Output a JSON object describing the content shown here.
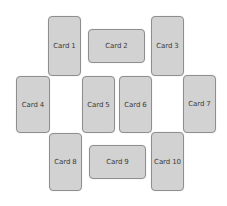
{
  "layout": {
    "background": "#ffffff",
    "card_fill": "#d2d2d2",
    "card_border": "#8e8e8e",
    "text_color": "#3b3b3b"
  },
  "cards": [
    {
      "label": "Card 1",
      "orientation": "portrait",
      "x": 48,
      "y": 16,
      "w": 33,
      "h": 60
    },
    {
      "label": "Card 2",
      "orientation": "landscape",
      "x": 88,
      "y": 29,
      "w": 57,
      "h": 34
    },
    {
      "label": "Card 3",
      "orientation": "portrait",
      "x": 151,
      "y": 16,
      "w": 33,
      "h": 60
    },
    {
      "label": "Card 4",
      "orientation": "portrait",
      "x": 16,
      "y": 76,
      "w": 34,
      "h": 57
    },
    {
      "label": "Card 5",
      "orientation": "portrait",
      "x": 82,
      "y": 76,
      "w": 33,
      "h": 57
    },
    {
      "label": "Card 6",
      "orientation": "portrait",
      "x": 119,
      "y": 76,
      "w": 33,
      "h": 57
    },
    {
      "label": "Card 7",
      "orientation": "portrait",
      "x": 183,
      "y": 75,
      "w": 33,
      "h": 58
    },
    {
      "label": "Card 8",
      "orientation": "portrait",
      "x": 49,
      "y": 133,
      "w": 33,
      "h": 58
    },
    {
      "label": "Card 9",
      "orientation": "landscape",
      "x": 89,
      "y": 145,
      "w": 57,
      "h": 34
    },
    {
      "label": "Card 10",
      "orientation": "portrait",
      "x": 151,
      "y": 132,
      "w": 33,
      "h": 59
    }
  ]
}
